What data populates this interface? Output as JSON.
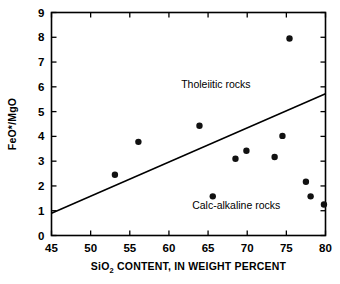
{
  "chart_data": {
    "type": "scatter",
    "title": "",
    "xlabel": "SiO2 CONTENT, IN WEIGHT PERCENT",
    "xlabel_prefix": "SiO",
    "xlabel_subscript": "2",
    "xlabel_suffix": " CONTENT, IN WEIGHT PERCENT",
    "ylabel": "FeO*/MgO",
    "xlim": [
      45,
      80
    ],
    "ylim": [
      0,
      9
    ],
    "xticks": [
      45,
      50,
      55,
      60,
      65,
      70,
      75,
      80
    ],
    "yticks": [
      0,
      1,
      2,
      3,
      4,
      5,
      6,
      7,
      8,
      9
    ],
    "xtick_labels": [
      "45",
      "50",
      "55",
      "60",
      "65",
      "70",
      "75",
      "80"
    ],
    "ytick_labels": [
      "0",
      "1",
      "2",
      "3",
      "4",
      "5",
      "6",
      "7",
      "8",
      "9"
    ],
    "grid": false,
    "legend": "none",
    "point_color": "#111111",
    "line_color": "#000000",
    "points": [
      {
        "x": 53.1,
        "y": 2.45
      },
      {
        "x": 56.1,
        "y": 3.78
      },
      {
        "x": 63.9,
        "y": 4.43
      },
      {
        "x": 65.6,
        "y": 1.58
      },
      {
        "x": 68.5,
        "y": 3.1
      },
      {
        "x": 69.9,
        "y": 3.42
      },
      {
        "x": 73.5,
        "y": 3.17
      },
      {
        "x": 74.5,
        "y": 4.02
      },
      {
        "x": 75.4,
        "y": 7.95
      },
      {
        "x": 77.5,
        "y": 2.17
      },
      {
        "x": 78.1,
        "y": 1.58
      },
      {
        "x": 79.8,
        "y": 1.25
      }
    ],
    "divider_line": {
      "x1": 45,
      "y1": 0.9,
      "x2": 80,
      "y2": 5.72
    },
    "annotations": [
      {
        "text": "Tholeiitic rocks",
        "x": 66.0,
        "y": 5.95
      },
      {
        "text": "Calc-alkaline rocks",
        "x": 68.6,
        "y": 1.05
      }
    ]
  }
}
